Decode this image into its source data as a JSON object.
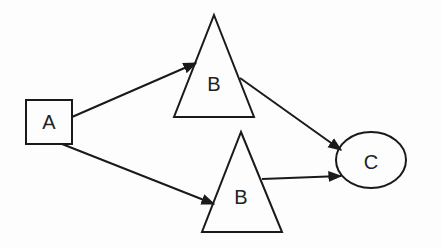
{
  "diagram": {
    "nodes": [
      {
        "id": "A",
        "label": "A",
        "shape": "rectangle"
      },
      {
        "id": "B1",
        "label": "B",
        "shape": "triangle"
      },
      {
        "id": "B2",
        "label": "B",
        "shape": "triangle"
      },
      {
        "id": "C",
        "label": "C",
        "shape": "ellipse"
      }
    ],
    "edges": [
      {
        "from": "A",
        "to": "B1"
      },
      {
        "from": "A",
        "to": "B2"
      },
      {
        "from": "B1",
        "to": "C"
      },
      {
        "from": "B2",
        "to": "C"
      }
    ],
    "colors": {
      "stroke": "#1a1a1a",
      "background": "#fdfdfd"
    }
  }
}
